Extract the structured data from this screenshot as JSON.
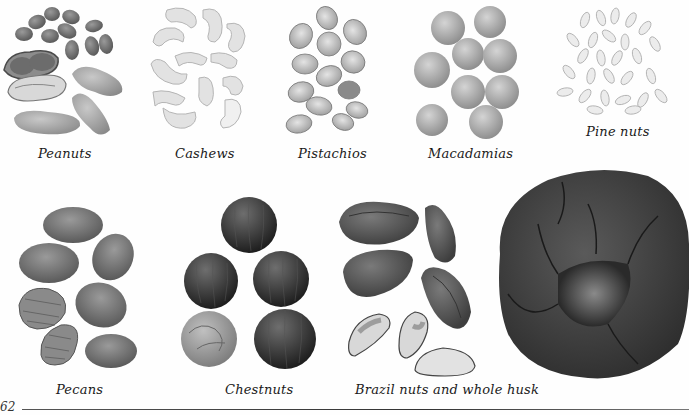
{
  "page": {
    "number": "62",
    "colors": {
      "background": "#fefefe",
      "text": "#1a1a1a",
      "rule": "#444444"
    }
  },
  "captions": {
    "peanuts": "Peanuts",
    "cashews": "Cashews",
    "pistachios": "Pistachios",
    "macadamias": "Macadamias",
    "pine_nuts": "Pine nuts",
    "pecans": "Pecans",
    "chestnuts": "Chestnuts",
    "brazil": "Brazil nuts and whole husk"
  },
  "images": [
    {
      "name": "peanuts",
      "description": "shelled peanuts and peanut pods"
    },
    {
      "name": "cashews",
      "description": "cashew nuts"
    },
    {
      "name": "pistachios",
      "description": "pistachios in shell"
    },
    {
      "name": "macadamias",
      "description": "macadamia nuts"
    },
    {
      "name": "pine-nuts",
      "description": "pine nuts"
    },
    {
      "name": "pecans",
      "description": "pecans in shell and pecan halves"
    },
    {
      "name": "chestnuts",
      "description": "chestnuts"
    },
    {
      "name": "brazil-nuts",
      "description": "brazil nuts in shell, kernels, and whole husk"
    }
  ]
}
